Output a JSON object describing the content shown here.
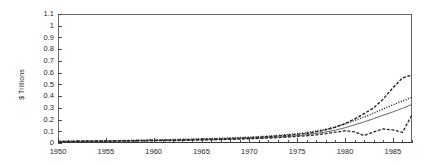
{
  "chart_data": {
    "type": "line",
    "title": "",
    "xlabel": "",
    "ylabel": "$ Trillions",
    "xlim": [
      1950,
      1987
    ],
    "ylim": [
      0,
      1.1
    ],
    "grid": false,
    "legend_position": "none",
    "ytick_labels": [
      "1.1",
      "1",
      "0.9",
      "0.8",
      "0.7",
      "0.6",
      "0.5",
      "0.4",
      "0.3",
      "0.2",
      "0.1",
      "0"
    ],
    "ytick_values": [
      1.1,
      1.0,
      0.9,
      0.8,
      0.7,
      0.6,
      0.5,
      0.4,
      0.3,
      0.2,
      0.1,
      0
    ],
    "xtick_labels": [
      "1950",
      "1955",
      "1960",
      "1965",
      "1970",
      "1975",
      "1980",
      "1985"
    ],
    "xtick_values": [
      1950,
      1955,
      1960,
      1965,
      1970,
      1975,
      1980,
      1985
    ],
    "x": [
      1950,
      1951,
      1952,
      1953,
      1954,
      1955,
      1956,
      1957,
      1958,
      1959,
      1960,
      1961,
      1962,
      1963,
      1964,
      1965,
      1966,
      1967,
      1968,
      1969,
      1970,
      1971,
      1972,
      1973,
      1974,
      1975,
      1976,
      1977,
      1978,
      1979,
      1980,
      1981,
      1982,
      1983,
      1984,
      1985,
      1986,
      1987
    ],
    "series": [
      {
        "name": "series-dashed-upper",
        "style": "dashed",
        "color": "#1a1a1a",
        "values": [
          0.013,
          0.014,
          0.015,
          0.016,
          0.017,
          0.018,
          0.019,
          0.02,
          0.021,
          0.023,
          0.024,
          0.025,
          0.027,
          0.028,
          0.03,
          0.032,
          0.034,
          0.036,
          0.039,
          0.042,
          0.045,
          0.049,
          0.054,
          0.06,
          0.066,
          0.073,
          0.082,
          0.095,
          0.112,
          0.135,
          0.165,
          0.205,
          0.25,
          0.3,
          0.375,
          0.47,
          0.555,
          0.58
        ]
      },
      {
        "name": "series-dotted",
        "style": "dotted",
        "color": "#222222",
        "values": [
          0.014,
          0.015,
          0.016,
          0.017,
          0.018,
          0.019,
          0.02,
          0.022,
          0.023,
          0.024,
          0.026,
          0.027,
          0.029,
          0.031,
          0.033,
          0.035,
          0.037,
          0.04,
          0.043,
          0.046,
          0.05,
          0.054,
          0.059,
          0.065,
          0.072,
          0.08,
          0.09,
          0.102,
          0.118,
          0.138,
          0.163,
          0.192,
          0.222,
          0.255,
          0.29,
          0.325,
          0.358,
          0.39
        ]
      },
      {
        "name": "series-solid-thin",
        "style": "solid",
        "color": "#555555",
        "values": [
          0.012,
          0.013,
          0.014,
          0.015,
          0.015,
          0.016,
          0.017,
          0.018,
          0.019,
          0.02,
          0.021,
          0.022,
          0.023,
          0.025,
          0.026,
          0.028,
          0.03,
          0.032,
          0.034,
          0.037,
          0.04,
          0.043,
          0.047,
          0.052,
          0.057,
          0.063,
          0.071,
          0.081,
          0.094,
          0.11,
          0.13,
          0.155,
          0.18,
          0.208,
          0.237,
          0.265,
          0.295,
          0.33
        ]
      },
      {
        "name": "series-dashed-lower",
        "style": "dashed",
        "color": "#2a2a2a",
        "values": [
          0.011,
          0.012,
          0.012,
          0.013,
          0.014,
          0.014,
          0.015,
          0.016,
          0.017,
          0.018,
          0.019,
          0.02,
          0.021,
          0.022,
          0.024,
          0.025,
          0.027,
          0.029,
          0.031,
          0.033,
          0.036,
          0.039,
          0.042,
          0.046,
          0.051,
          0.056,
          0.062,
          0.07,
          0.08,
          0.092,
          0.105,
          0.095,
          0.063,
          0.095,
          0.12,
          0.112,
          0.09,
          0.24
        ]
      }
    ]
  }
}
